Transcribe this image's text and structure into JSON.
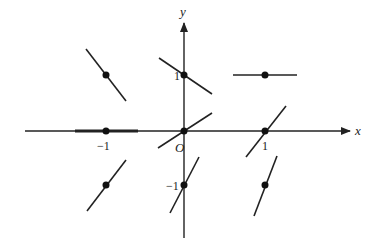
{
  "diagram": {
    "type": "slope-field",
    "axes": {
      "x_label": "x",
      "y_label": "y",
      "origin_label": "O",
      "x_ticks": [
        {
          "value": -1,
          "label": "−1"
        },
        {
          "value": 1,
          "label": "1"
        }
      ],
      "y_ticks": [
        {
          "value": 1,
          "label": "1"
        },
        {
          "value": -1,
          "label": "−1"
        }
      ]
    },
    "points": [
      {
        "x": -1,
        "y": 1,
        "slope": "negative-steep"
      },
      {
        "x": 0,
        "y": 1,
        "slope": "negative"
      },
      {
        "x": 1,
        "y": 1,
        "slope": "zero"
      },
      {
        "x": -1,
        "y": 0,
        "slope": "zero"
      },
      {
        "x": 0,
        "y": 0,
        "slope": "positive"
      },
      {
        "x": 1,
        "y": 0,
        "slope": "positive-steep"
      },
      {
        "x": -1,
        "y": -1,
        "slope": "positive-steep"
      },
      {
        "x": 0,
        "y": -1,
        "slope": "positive-steeper"
      },
      {
        "x": 1,
        "y": -1,
        "slope": "positive-steepest"
      }
    ],
    "colors": {
      "line": "#222222",
      "background": "#ffffff"
    }
  }
}
